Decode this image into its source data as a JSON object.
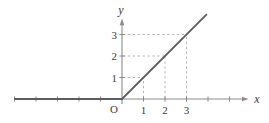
{
  "figure": {
    "x_axis_label": "x",
    "y_axis_label": "y",
    "origin_label": "O"
  },
  "chart_data": {
    "type": "line",
    "title": "",
    "xlabel": "x",
    "ylabel": "y",
    "origin_label": "O",
    "xlim": [
      -5.2,
      6.0
    ],
    "ylim": [
      -0.7,
      4.4
    ],
    "grid": false,
    "legend": "none",
    "x_ticks_labeled": [
      1,
      2,
      3
    ],
    "x_ticks_unlabeled": [
      -5,
      -4,
      -3,
      -2,
      -1,
      4,
      5
    ],
    "y_ticks_labeled": [
      1,
      2,
      3
    ],
    "series": [
      {
        "name": "y = 0 for x < 0; y = x for x >= 0",
        "points": [
          [
            -5.0,
            0
          ],
          [
            0,
            0
          ],
          [
            3.95,
            3.95
          ]
        ]
      }
    ],
    "guide_points": [
      1,
      2,
      3
    ],
    "guide_style": "dashed",
    "colors": {
      "function_line": "#5d5d5d",
      "axis": "#8c8c8c",
      "guide": "#b5b5b5",
      "text": "#3d3d3d"
    }
  }
}
